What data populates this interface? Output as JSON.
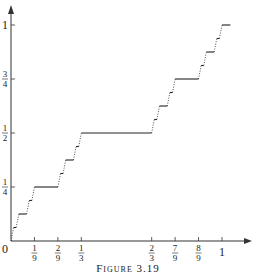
{
  "figure": {
    "caption": "Figure 3.19",
    "axes_color": "#333333",
    "curve_color": "#222222"
  },
  "chart_data": {
    "type": "line",
    "xlabel": "",
    "ylabel": "",
    "xlim": [
      0,
      1.1
    ],
    "ylim": [
      0,
      1.05
    ],
    "x_ticks": [
      {
        "value": 0.1111,
        "num": "1",
        "den": "9"
      },
      {
        "value": 0.2222,
        "num": "2",
        "den": "9"
      },
      {
        "value": 0.3333,
        "num": "1",
        "den": "3"
      },
      {
        "value": 0.6667,
        "num": "2",
        "den": "3"
      },
      {
        "value": 0.7778,
        "num": "7",
        "den": "9"
      },
      {
        "value": 0.8889,
        "num": "8",
        "den": "9"
      },
      {
        "value": 1.0,
        "label": "1"
      }
    ],
    "y_ticks": [
      {
        "value": 0.25,
        "num": "1",
        "den": "4"
      },
      {
        "value": 0.5,
        "num": "1",
        "den": "2"
      },
      {
        "value": 0.75,
        "num": "3",
        "den": "4"
      },
      {
        "value": 1.0,
        "label": "1"
      }
    ],
    "origin_label": "0",
    "plateaus": [
      {
        "x": [
          0.3333,
          0.6667
        ],
        "y": 0.5
      },
      {
        "x": [
          0.1111,
          0.2222
        ],
        "y": 0.25
      },
      {
        "x": [
          0.7778,
          0.8889
        ],
        "y": 0.75
      },
      {
        "x": [
          0.037,
          0.0741
        ],
        "y": 0.125
      },
      {
        "x": [
          0.2593,
          0.2963
        ],
        "y": 0.375
      },
      {
        "x": [
          0.7037,
          0.7407
        ],
        "y": 0.625
      },
      {
        "x": [
          0.9259,
          0.963
        ],
        "y": 0.875
      },
      {
        "x": [
          1.0,
          1.04
        ],
        "y": 1.0
      }
    ],
    "grid": false,
    "legend": null
  }
}
